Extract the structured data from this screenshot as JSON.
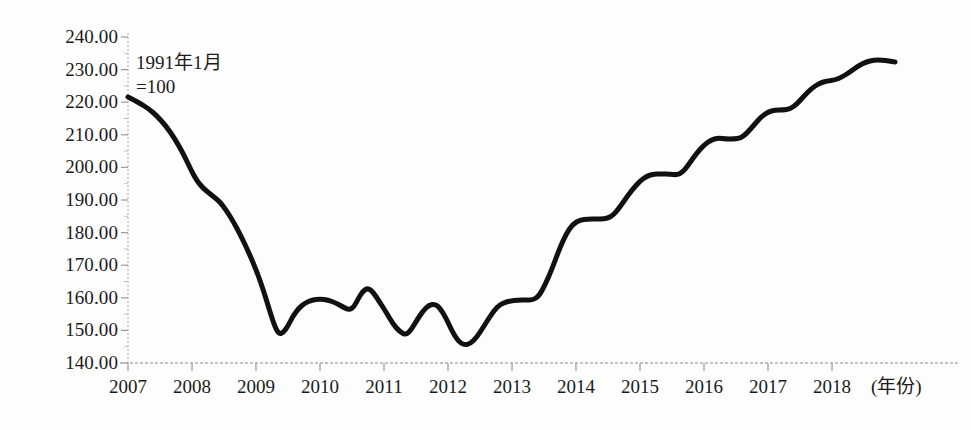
{
  "chart_data": {
    "type": "line",
    "title": "",
    "subtitle": "",
    "xlabel": "年份",
    "ylabel": "",
    "annotation": {
      "line1": "1991年1月",
      "line2": "=100"
    },
    "xlim": [
      2007,
      2019
    ],
    "ylim": [
      140,
      240
    ],
    "grid": false,
    "legend": null,
    "x_tick_labels": [
      "2007",
      "2008",
      "2009",
      "2010",
      "2011",
      "2012",
      "2013",
      "2014",
      "2015",
      "2016",
      "2017",
      "2018"
    ],
    "x_tick_values": [
      2007,
      2008,
      2009,
      2010,
      2011,
      2012,
      2013,
      2014,
      2015,
      2016,
      2017,
      2018
    ],
    "x_axis_unit_label": "(年份)",
    "y_tick_labels": [
      "240.00",
      "230.00",
      "220.00",
      "210.00",
      "200.00",
      "190.00",
      "180.00",
      "170.00",
      "160.00",
      "150.00",
      "140.00"
    ],
    "y_tick_values": [
      240,
      230,
      220,
      210,
      200,
      190,
      180,
      170,
      160,
      150,
      140
    ],
    "line_color": "#111111",
    "line_width_px": 5,
    "series": [
      {
        "name": "指数",
        "x": [
          2007.0,
          2007.17,
          2007.33,
          2007.5,
          2007.67,
          2007.83,
          2008.0,
          2008.17,
          2008.33,
          2008.5,
          2008.67,
          2008.83,
          2009.0,
          2009.17,
          2009.33,
          2009.5,
          2009.67,
          2009.83,
          2010.0,
          2010.17,
          2010.33,
          2010.5,
          2010.67,
          2010.83,
          2011.0,
          2011.17,
          2011.33,
          2011.5,
          2011.67,
          2011.83,
          2012.0,
          2012.17,
          2012.33,
          2012.5,
          2012.67,
          2012.83,
          2013.0,
          2013.17,
          2013.33,
          2013.5,
          2013.67,
          2013.83,
          2014.0,
          2014.17,
          2014.33,
          2014.5,
          2014.67,
          2014.83,
          2015.0,
          2015.17,
          2015.33,
          2015.5,
          2015.67,
          2015.83,
          2016.0,
          2016.17,
          2016.33,
          2016.5,
          2016.67,
          2016.83,
          2017.0,
          2017.17,
          2017.33,
          2017.5,
          2017.67,
          2017.83,
          2018.0,
          2018.17,
          2018.33,
          2018.5
        ],
        "values": [
          221.0,
          219.5,
          217.5,
          215.0,
          211.0,
          206.0,
          200.0,
          194.0,
          188.5,
          185.5,
          183.5,
          180.0,
          174.0,
          166.0,
          158.0,
          152.5,
          151.0,
          152.5,
          156.5,
          158.5,
          159.0,
          158.0,
          156.5,
          156.0,
          157.0,
          160.5,
          162.5,
          161.0,
          157.5,
          153.5,
          151.0,
          152.5,
          155.5,
          156.0,
          153.5,
          150.0,
          147.0,
          147.5,
          151.5,
          155.5,
          157.5,
          158.0,
          158.0,
          162.5,
          170.0,
          176.0,
          179.0,
          180.0,
          180.0,
          181.0,
          185.0,
          188.5,
          190.0,
          190.0,
          189.5,
          191.0,
          194.5,
          197.5,
          197.0,
          197.0,
          198.5,
          202.0,
          203.5,
          203.5,
          205.0,
          208.5,
          212.0,
          215.0,
          216.5,
          218.5
        ]
      }
    ],
    "key_points": {
      "start_2007": 221.0,
      "trough_2009": 151.0,
      "local_peak_2010": 162.5,
      "minimum_2012": 147.0,
      "plateau_2014": 180.0,
      "plateau_2015": 190.0,
      "plateau_2016": 197.0,
      "end_peak_2018": 228.0
    },
    "geometry": {
      "x_axis_y_px": 363,
      "y_axis_x_px": 128,
      "px_per_year": 64,
      "y_top_px": 37,
      "y_bottom_px": 363
    },
    "path_points_px": [
      [
        128,
        97
      ],
      [
        134,
        100
      ],
      [
        141,
        104
      ],
      [
        149,
        109
      ],
      [
        157,
        116
      ],
      [
        166,
        126
      ],
      [
        175,
        139
      ],
      [
        184,
        155
      ],
      [
        191,
        170
      ],
      [
        197,
        181
      ],
      [
        203,
        188
      ],
      [
        209,
        193
      ],
      [
        214,
        197
      ],
      [
        220,
        202
      ],
      [
        226,
        210
      ],
      [
        233,
        221
      ],
      [
        241,
        236
      ],
      [
        249,
        253
      ],
      [
        257,
        272
      ],
      [
        264,
        292
      ],
      [
        270,
        312
      ],
      [
        275,
        327
      ],
      [
        279,
        334
      ],
      [
        283,
        333
      ],
      [
        288,
        326
      ],
      [
        293,
        316
      ],
      [
        299,
        308
      ],
      [
        305,
        303
      ],
      [
        312,
        300
      ],
      [
        320,
        299
      ],
      [
        328,
        300
      ],
      [
        336,
        303
      ],
      [
        343,
        307
      ],
      [
        349,
        310
      ],
      [
        354,
        307
      ],
      [
        358,
        299
      ],
      [
        363,
        291
      ],
      [
        368,
        288
      ],
      [
        373,
        292
      ],
      [
        379,
        301
      ],
      [
        386,
        312
      ],
      [
        393,
        324
      ],
      [
        400,
        332
      ],
      [
        406,
        335
      ],
      [
        411,
        330
      ],
      [
        417,
        320
      ],
      [
        423,
        311
      ],
      [
        429,
        305
      ],
      [
        435,
        304
      ],
      [
        440,
        308
      ],
      [
        446,
        318
      ],
      [
        452,
        331
      ],
      [
        458,
        341
      ],
      [
        464,
        345
      ],
      [
        470,
        344
      ],
      [
        477,
        337
      ],
      [
        484,
        326
      ],
      [
        491,
        315
      ],
      [
        497,
        307
      ],
      [
        503,
        303
      ],
      [
        510,
        301
      ],
      [
        518,
        300
      ],
      [
        526,
        300
      ],
      [
        533,
        300
      ],
      [
        539,
        296
      ],
      [
        545,
        285
      ],
      [
        552,
        269
      ],
      [
        559,
        250
      ],
      [
        566,
        234
      ],
      [
        573,
        224
      ],
      [
        580,
        220
      ],
      [
        588,
        219
      ],
      [
        596,
        219
      ],
      [
        604,
        219
      ],
      [
        611,
        217
      ],
      [
        617,
        211
      ],
      [
        624,
        201
      ],
      [
        632,
        190
      ],
      [
        640,
        181
      ],
      [
        647,
        176
      ],
      [
        654,
        174
      ],
      [
        662,
        174
      ],
      [
        670,
        174
      ],
      [
        677,
        175
      ],
      [
        683,
        172
      ],
      [
        689,
        164
      ],
      [
        696,
        154
      ],
      [
        704,
        145
      ],
      [
        711,
        140
      ],
      [
        718,
        138
      ],
      [
        726,
        139
      ],
      [
        734,
        139
      ],
      [
        741,
        138
      ],
      [
        747,
        133
      ],
      [
        754,
        125
      ],
      [
        761,
        117
      ],
      [
        768,
        112
      ],
      [
        775,
        110
      ],
      [
        783,
        110
      ],
      [
        790,
        109
      ],
      [
        797,
        104
      ],
      [
        804,
        96
      ],
      [
        812,
        88
      ],
      [
        820,
        83
      ],
      [
        827,
        81
      ],
      [
        835,
        80
      ],
      [
        842,
        77
      ],
      [
        850,
        72
      ],
      [
        858,
        66
      ],
      [
        866,
        62
      ],
      [
        874,
        60
      ],
      [
        882,
        60
      ],
      [
        889,
        61
      ],
      [
        895,
        62
      ]
    ]
  },
  "axes": {
    "y_labels": [
      "240.00",
      "230.00",
      "220.00",
      "210.00",
      "200.00",
      "190.00",
      "180.00",
      "170.00",
      "160.00",
      "150.00",
      "140.00"
    ],
    "x_labels": [
      "2007",
      "2008",
      "2009",
      "2010",
      "2011",
      "2012",
      "2013",
      "2014",
      "2015",
      "2016",
      "2017",
      "2018"
    ],
    "x_unit": "(年份)"
  },
  "annotation": {
    "line1": "1991年1月",
    "line2": "=100"
  }
}
